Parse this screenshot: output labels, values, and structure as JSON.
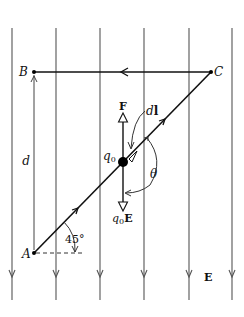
{
  "figure": {
    "type": "physics-diagram",
    "field": {
      "label": "E",
      "direction": "down",
      "line_x": [
        12,
        56,
        100,
        144,
        189,
        232
      ],
      "line_top": 28,
      "line_bottom": 300,
      "arrow_y": 276
    },
    "points": {
      "A": {
        "label": "A",
        "x": 34,
        "y": 253
      },
      "B": {
        "label": "B",
        "x": 34,
        "y": 72
      },
      "C": {
        "label": "C",
        "x": 211,
        "y": 72
      }
    },
    "charge": {
      "label": "q0",
      "label_main": "q",
      "label_sub": "0",
      "x": 123,
      "y": 162
    },
    "force_label": "F",
    "field_force_label_main": "q",
    "field_force_label_sub": "0",
    "field_force_label_vec": "E",
    "displacement_label": "dl",
    "displacement_label_d": "d",
    "displacement_label_l": "l",
    "angle_label": "θ",
    "incline_angle_label": "45°",
    "distance_label": "d"
  }
}
